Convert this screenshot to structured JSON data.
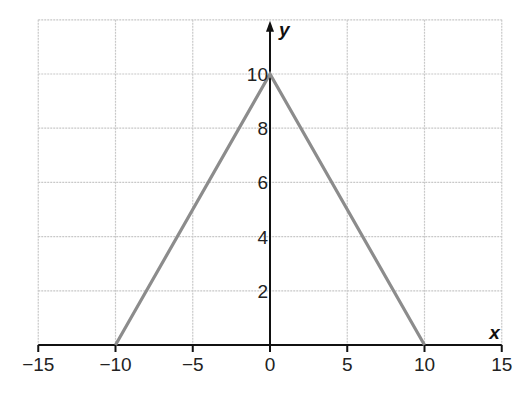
{
  "chart_data": {
    "type": "line",
    "title": "",
    "xlabel": "x",
    "ylabel": "y",
    "xlim": [
      -15,
      15
    ],
    "ylim": [
      0,
      12
    ],
    "grid": true,
    "x_ticks": [
      -15,
      -10,
      -5,
      0,
      5,
      10,
      15
    ],
    "x_tick_labels": [
      "−15",
      "−10",
      "−5",
      "0",
      "5",
      "10",
      "15"
    ],
    "y_ticks": [
      2,
      4,
      6,
      8,
      10
    ],
    "y_tick_labels": [
      "2",
      "4",
      "6",
      "8",
      "10"
    ],
    "series": [
      {
        "name": "y = 10 - |x|",
        "color": "#8c8c8c",
        "x": [
          -10,
          0,
          10
        ],
        "y": [
          0,
          10,
          0
        ]
      }
    ],
    "legend": null
  },
  "colors": {
    "grid": "#c8c8c8",
    "axis": "#111111",
    "line": "#8c8c8c"
  }
}
